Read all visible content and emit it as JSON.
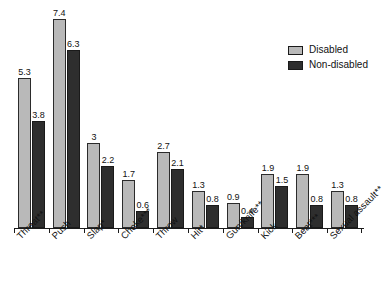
{
  "chart_data": {
    "type": "bar",
    "title": "",
    "subtitle": "",
    "xlabel": "",
    "ylabel": "",
    "ylim": [
      0,
      8
    ],
    "grid": false,
    "legend_position": "top-right",
    "categories": [
      "Threat**",
      "Push",
      "Slap*",
      "Choke***",
      "Throw",
      "Hit*",
      "Gun/knife**",
      "Kick",
      "Beat***",
      "Sexual assault**"
    ],
    "series": [
      {
        "name": "Disabled",
        "color": "#b9b9b9",
        "values": [
          5.3,
          7.4,
          3,
          1.7,
          2.7,
          1.3,
          0.9,
          1.9,
          1.9,
          1.3
        ],
        "labels": [
          "5.3",
          "7.4",
          "3",
          "1.7",
          "2.7",
          "1.3",
          "0.9",
          "1.9",
          "1.9",
          "1.3"
        ]
      },
      {
        "name": "Non-disabled",
        "color": "#2e2e2e",
        "values": [
          3.8,
          6.3,
          2.2,
          0.6,
          2.1,
          0.8,
          0.4,
          1.5,
          0.8,
          0.8
        ],
        "labels": [
          "3.8",
          "6.3",
          "2.2",
          "0.6",
          "2.1",
          "0.8",
          "0.4",
          "1.5",
          "0.8",
          "0.8"
        ]
      }
    ]
  },
  "legend": {
    "items": [
      {
        "label": "Disabled",
        "color": "#b9b9b9"
      },
      {
        "label": "Non-disabled",
        "color": "#2e2e2e"
      }
    ]
  }
}
